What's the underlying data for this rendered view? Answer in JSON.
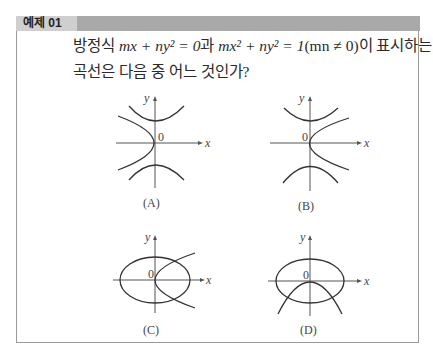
{
  "header": {
    "label": "예제 01"
  },
  "question": {
    "line1_prefix": "방정식 ",
    "eq1": "mx + ny² = 0",
    "conj": "과 ",
    "eq2": "mx² + ny² = 1",
    "cond": "(mn ≠ 0)",
    "line1_suffix": "이 표시하는",
    "line2": "곡선은 다음 중 어느 것인가?"
  },
  "graphs": [
    {
      "id": "A",
      "caption": "(A)",
      "x_label": "x",
      "y_label": "y",
      "origin_label": "0",
      "curves": [
        "parabola opening left (vertex at origin)",
        "hyperbola opening up/down"
      ]
    },
    {
      "id": "B",
      "caption": "(B)",
      "x_label": "x",
      "y_label": "y",
      "origin_label": "0",
      "curves": [
        "parabola opening right (vertex at origin)",
        "hyperbola opening up/down"
      ]
    },
    {
      "id": "C",
      "caption": "(C)",
      "x_label": "x",
      "y_label": "y",
      "origin_label": "0",
      "curves": [
        "ellipse centered at origin",
        "parabola opening right (vertex at origin)"
      ]
    },
    {
      "id": "D",
      "caption": "(D)",
      "x_label": "x",
      "y_label": "y",
      "origin_label": "0",
      "curves": [
        "ellipse centered at origin",
        "parabola opening down (vertex at origin)"
      ]
    }
  ]
}
